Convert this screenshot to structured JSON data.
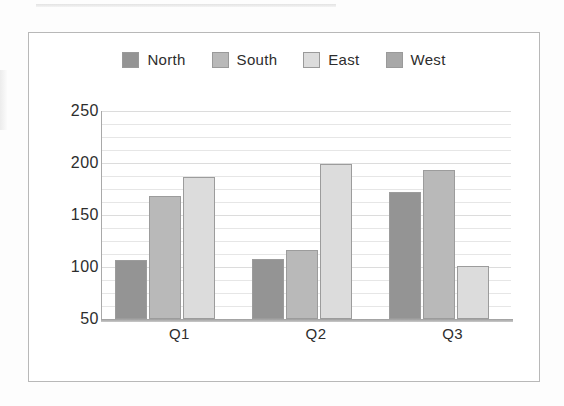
{
  "chart_data": {
    "type": "bar",
    "title": "",
    "subtitle": "",
    "xlabel": "",
    "ylabel": "",
    "categories": [
      "Q1",
      "Q2",
      "Q3"
    ],
    "series": [
      {
        "name": "North",
        "values": [
          107,
          108,
          172
        ],
        "color": "#949494"
      },
      {
        "name": "South",
        "values": [
          168,
          116,
          193
        ],
        "color": "#b9b9b9"
      },
      {
        "name": "East",
        "values": [
          187,
          199,
          101
        ],
        "color": "#dcdcdc"
      },
      {
        "name": "West",
        "values": [
          null,
          null,
          null
        ],
        "color": "#a8a8a8"
      }
    ],
    "ylim": [
      50,
      250
    ],
    "y_ticks": [
      250,
      200,
      150,
      100,
      50
    ],
    "y_tick_labels": [
      "250",
      "200",
      "150",
      "100",
      "50"
    ],
    "minor_gridline_step": 12.5,
    "grid": true,
    "legend_position": "top-center",
    "legend_entries": [
      "North",
      "South",
      "East",
      "West"
    ],
    "annotations": []
  },
  "chart": {
    "frame_border_color": "#b8b8b8",
    "background_color": "#ffffff",
    "axis_color": "#9d9d9d",
    "gridline_color": "#e6e6e6",
    "text_color": "#2d2d2d"
  }
}
